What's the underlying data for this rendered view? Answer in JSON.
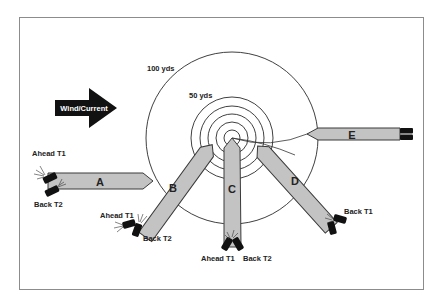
{
  "diagram": {
    "frame": {
      "border_color": "#8c8c8c",
      "background": "#ffffff"
    },
    "wind_arrow": {
      "label": "Wind/Current",
      "color": "#111111",
      "text_color": "#ffffff"
    },
    "range_rings": {
      "outer_label": "100 yds",
      "inner_label": "50 yds",
      "ring_count_inner": 5
    },
    "vessels": [
      {
        "id": "A",
        "label": "A",
        "thrusters": [
          {
            "label": "Ahead T1"
          },
          {
            "label": "Back T2"
          }
        ]
      },
      {
        "id": "B",
        "label": "B",
        "thrusters": [
          {
            "label": "Ahead T1"
          },
          {
            "label": "Back T2"
          }
        ]
      },
      {
        "id": "C",
        "label": "C",
        "thrusters": [
          {
            "label": "Ahead T1"
          },
          {
            "label": "Back T2"
          }
        ]
      },
      {
        "id": "D",
        "label": "D",
        "thrusters": [
          {
            "label": "Back T1"
          }
        ]
      },
      {
        "id": "E",
        "label": "E",
        "thrusters": []
      }
    ],
    "colors": {
      "hull": "#c3c3c3",
      "outline": "#3a3a3a",
      "propeller": "#111111"
    }
  }
}
